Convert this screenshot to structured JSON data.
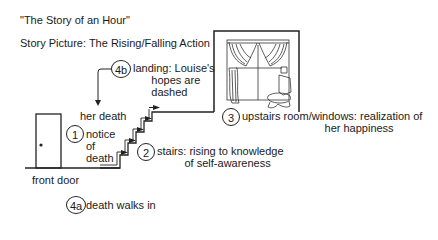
{
  "header": {
    "title": "\"The Story of an Hour\"",
    "subtitle": "Story Picture: The Rising/Falling Action"
  },
  "labels": {
    "front_door": "front door",
    "her_death": "her death"
  },
  "stages": [
    {
      "number": "1",
      "text": "notice\nof\ndeath"
    },
    {
      "number": "2",
      "text": "stairs: rising to knowledge\n         of self-awareness"
    },
    {
      "number": "3",
      "text": "upstairs room/windows: realization of\n                           her happiness"
    },
    {
      "number": "4a",
      "text": "death walks in"
    },
    {
      "number": "4b",
      "text": "landing: Louise's\n      hopes are\n      dashed"
    }
  ],
  "icons": {
    "door": "door-icon",
    "window": "curtained-window-icon",
    "stairs": "staircase-icon",
    "arrow": "arrow-down-icon"
  },
  "colors": {
    "line": "#222222",
    "background": "#ffffff"
  }
}
